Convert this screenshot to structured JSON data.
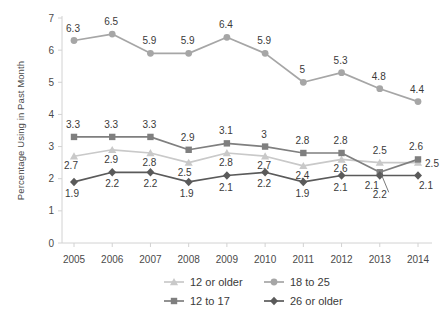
{
  "chart_data": {
    "type": "line",
    "title": "",
    "xlabel": "",
    "ylabel": "Percentage Using in Past Month",
    "categories": [
      "2005",
      "2006",
      "2007",
      "2008",
      "2009",
      "2010",
      "2011",
      "2012",
      "2013",
      "2014"
    ],
    "x": [
      2005,
      2006,
      2007,
      2008,
      2009,
      2010,
      2011,
      2012,
      2013,
      2014
    ],
    "ylim": [
      0,
      7
    ],
    "yticks": [
      "0",
      "1",
      "2",
      "3",
      "4",
      "5",
      "6",
      "7"
    ],
    "grid": false,
    "legend_position": "bottom",
    "series": [
      {
        "name": "12 or older",
        "marker": "triangle",
        "color": "#c9c9c9",
        "values": [
          2.7,
          2.9,
          2.8,
          2.5,
          2.8,
          2.7,
          2.4,
          2.6,
          2.5,
          2.5
        ],
        "labels": [
          "2.7",
          "2.9",
          "2.8",
          "2.5",
          "2.8",
          "2.7",
          "2.4",
          "2.6",
          "2.5",
          "2.5"
        ]
      },
      {
        "name": "18 to 25",
        "marker": "circle",
        "color": "#a6a6a6",
        "values": [
          6.3,
          6.5,
          5.9,
          5.9,
          6.4,
          5.9,
          5.0,
          5.3,
          4.8,
          4.4
        ],
        "labels": [
          "6.3",
          "6.5",
          "5.9",
          "5.9",
          "6.4",
          "5.9",
          "5",
          "5.3",
          "4.8",
          "4.4"
        ]
      },
      {
        "name": "12 to 17",
        "marker": "square",
        "color": "#7f7f7f",
        "values": [
          3.3,
          3.3,
          3.3,
          2.9,
          3.1,
          3.0,
          2.8,
          2.8,
          2.2,
          2.6
        ],
        "labels": [
          "3.3",
          "3.3",
          "3.3",
          "2.9",
          "3.1",
          "3",
          "2.8",
          "2.8",
          "2.2",
          "2.6"
        ]
      },
      {
        "name": "26 or older",
        "marker": "diamond",
        "color": "#5a5a5a",
        "values": [
          1.9,
          2.2,
          2.2,
          1.9,
          2.1,
          2.2,
          1.9,
          2.1,
          2.1,
          2.1
        ],
        "labels": [
          "1.9",
          "2.2",
          "2.2",
          "1.9",
          "2.1",
          "2.2",
          "1.9",
          "2.1",
          "2.1",
          "2.1"
        ]
      }
    ]
  },
  "legend": {
    "items": [
      {
        "label": "12 or older",
        "marker": "triangle",
        "color": "#c9c9c9"
      },
      {
        "label": "18 to 25",
        "marker": "circle",
        "color": "#a6a6a6"
      },
      {
        "label": "12 to 17",
        "marker": "square",
        "color": "#7f7f7f"
      },
      {
        "label": "26 or older",
        "marker": "diamond",
        "color": "#5a5a5a"
      }
    ]
  },
  "axis": {
    "y_title": "Percentage Using in Past Month",
    "line_color": "#d2d2d2"
  }
}
